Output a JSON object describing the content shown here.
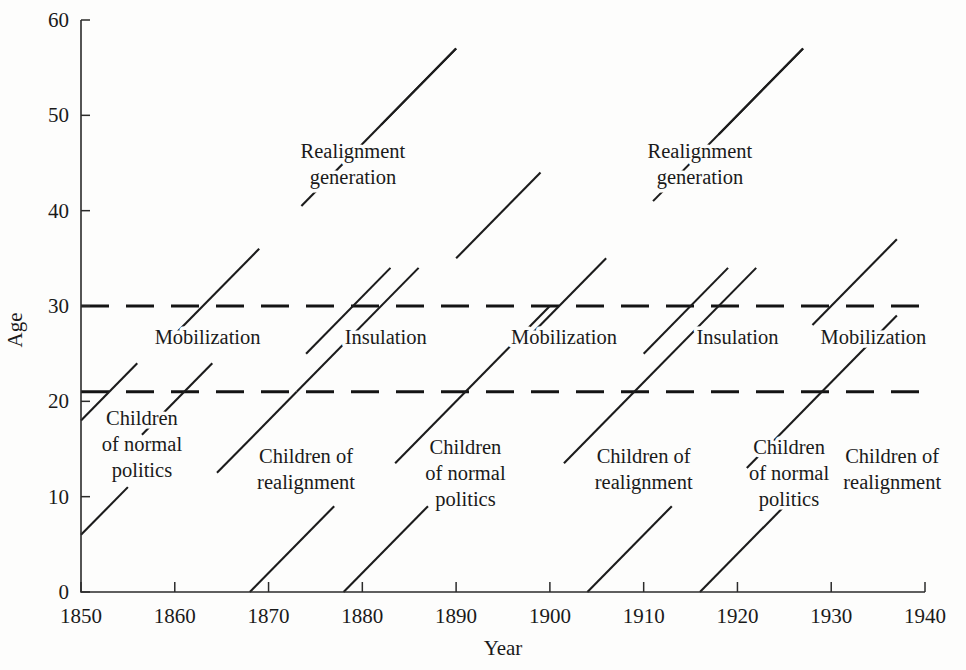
{
  "chart_data": {
    "type": "line",
    "title": "",
    "xlabel": "Year",
    "ylabel": "Age",
    "xlim": [
      1850,
      1940
    ],
    "ylim": [
      0,
      60
    ],
    "grid": false,
    "legend": "none",
    "x_ticks": [
      1850,
      1860,
      1870,
      1880,
      1890,
      1900,
      1910,
      1920,
      1930,
      1940
    ],
    "y_ticks": [
      0,
      10,
      20,
      30,
      40,
      50,
      60
    ],
    "reference_lines": [
      {
        "name": "adult-entry-threshold",
        "axis": "y",
        "value": 21,
        "style": "dashed"
      },
      {
        "name": "generation-threshold",
        "axis": "y",
        "value": 30,
        "style": "dashed"
      }
    ],
    "series": [
      {
        "name": "cohort-1850-normal-a",
        "x": [
          1850,
          1856
        ],
        "y": [
          18,
          24
        ]
      },
      {
        "name": "cohort-1850-normal-b",
        "x": [
          1850,
          1855
        ],
        "y": [
          6,
          11
        ]
      },
      {
        "name": "cohort-mobilization-1",
        "x": [
          1856.5,
          1864
        ],
        "y": [
          16.5,
          24
        ]
      },
      {
        "name": "cohort-realign-1-lower",
        "x": [
          1860,
          1869
        ],
        "y": [
          27,
          36
        ]
      },
      {
        "name": "cohort-realign-1-upper",
        "x": [
          1873.5,
          1890
        ],
        "y": [
          40.5,
          57
        ]
      },
      {
        "name": "cohort-1868-children-a",
        "x": [
          1868,
          1877
        ],
        "y": [
          0,
          9
        ]
      },
      {
        "name": "cohort-1868-children-b",
        "x": [
          1864.5,
          1873
        ],
        "y": [
          12.5,
          21
        ]
      },
      {
        "name": "cohort-1868-children-c",
        "x": [
          1873,
          1886
        ],
        "y": [
          21,
          34
        ]
      },
      {
        "name": "cohort-insulation-1-lower",
        "x": [
          1874,
          1883
        ],
        "y": [
          25,
          34
        ]
      },
      {
        "name": "cohort-insulation-1-upper",
        "x": [
          1882,
          1890
        ],
        "y": [
          49,
          57
        ]
      },
      {
        "name": "cohort-1878-children-a",
        "x": [
          1878,
          1887
        ],
        "y": [
          0,
          9
        ]
      },
      {
        "name": "cohort-1878-children-b",
        "x": [
          1883.5,
          1891
        ],
        "y": [
          13.5,
          21
        ]
      },
      {
        "name": "cohort-normal-2",
        "x": [
          1891,
          1900
        ],
        "y": [
          21,
          30
        ]
      },
      {
        "name": "cohort-mobilization-2-upper",
        "x": [
          1890,
          1899
        ],
        "y": [
          35,
          44
        ]
      },
      {
        "name": "cohort-realign-2-lower",
        "x": [
          1898,
          1906
        ],
        "y": [
          27,
          35
        ]
      },
      {
        "name": "cohort-realign-2-upper",
        "x": [
          1911,
          1927
        ],
        "y": [
          41,
          57
        ]
      },
      {
        "name": "cohort-1904-children-a",
        "x": [
          1904,
          1913
        ],
        "y": [
          0,
          9
        ]
      },
      {
        "name": "cohort-1904-children-b",
        "x": [
          1901.5,
          1909
        ],
        "y": [
          13.5,
          21
        ]
      },
      {
        "name": "cohort-1909-children",
        "x": [
          1909,
          1922
        ],
        "y": [
          21,
          34
        ]
      },
      {
        "name": "cohort-insulation-2-lower",
        "x": [
          1910,
          1919
        ],
        "y": [
          25,
          34
        ]
      },
      {
        "name": "cohort-insulation-2-upper",
        "x": [
          1918,
          1927
        ],
        "y": [
          48,
          57
        ]
      },
      {
        "name": "cohort-1916-children-a",
        "x": [
          1916,
          1925
        ],
        "y": [
          0,
          9
        ]
      },
      {
        "name": "cohort-1916-children-b",
        "x": [
          1921,
          1929
        ],
        "y": [
          13,
          21
        ]
      },
      {
        "name": "cohort-mobilization-3",
        "x": [
          1929,
          1937
        ],
        "y": [
          21,
          29
        ]
      },
      {
        "name": "cohort-final",
        "x": [
          1928,
          1937
        ],
        "y": [
          28,
          37
        ]
      }
    ],
    "annotations": [
      {
        "name": "realignment-generation-1",
        "text_lines": [
          "Realignment",
          "generation"
        ],
        "x": 1879,
        "y": 45.5
      },
      {
        "name": "realignment-generation-2",
        "text_lines": [
          "Realignment",
          "generation"
        ],
        "x": 1916,
        "y": 45.5
      },
      {
        "name": "mobilization-1",
        "text_lines": [
          "Mobilization"
        ],
        "x": 1863.5,
        "y": 26
      },
      {
        "name": "insulation-1",
        "text_lines": [
          "Insulation"
        ],
        "x": 1882.5,
        "y": 26
      },
      {
        "name": "mobilization-2",
        "text_lines": [
          "Mobilization"
        ],
        "x": 1901.5,
        "y": 26
      },
      {
        "name": "insulation-2",
        "text_lines": [
          "Insulation"
        ],
        "x": 1920,
        "y": 26
      },
      {
        "name": "mobilization-3",
        "text_lines": [
          "Mobilization"
        ],
        "x": 1934.5,
        "y": 26
      },
      {
        "name": "children-normal-politics-1",
        "text_lines": [
          "Children",
          "of normal",
          "politics"
        ],
        "x": 1856.5,
        "y": 17.5
      },
      {
        "name": "children-realignment-1",
        "text_lines": [
          "Children of",
          "realignment"
        ],
        "x": 1874,
        "y": 13.5
      },
      {
        "name": "children-normal-politics-2",
        "text_lines": [
          "Children",
          "of normal",
          "politics"
        ],
        "x": 1891,
        "y": 14.5
      },
      {
        "name": "children-realignment-2",
        "text_lines": [
          "Children of",
          "realignment"
        ],
        "x": 1910,
        "y": 13.5
      },
      {
        "name": "children-normal-politics-3",
        "text_lines": [
          "Children",
          "of normal",
          "politics"
        ],
        "x": 1925.5,
        "y": 14.5
      },
      {
        "name": "children-realignment-3",
        "text_lines": [
          "Children of",
          "realignment"
        ],
        "x": 1936.5,
        "y": 13.5
      }
    ]
  },
  "axis": {
    "y_title": "Age",
    "x_title": "Year",
    "y_tick_labels": [
      "0",
      "10",
      "20",
      "30",
      "40",
      "50",
      "60"
    ],
    "x_tick_labels": [
      "1850",
      "1860",
      "1870",
      "1880",
      "1890",
      "1900",
      "1910",
      "1920",
      "1930",
      "1940"
    ]
  },
  "labels": {
    "realignment_generation_l1": "Realignment",
    "realignment_generation_l2": "generation",
    "mobilization": "Mobilization",
    "insulation": "Insulation",
    "children_l1": "Children",
    "children_of_normal": "of normal",
    "children_politics": "politics",
    "children_of": "Children of",
    "children_realignment": "realignment"
  },
  "colors": {
    "ink": "#1a1a1a",
    "background": "#fdfdfc"
  }
}
